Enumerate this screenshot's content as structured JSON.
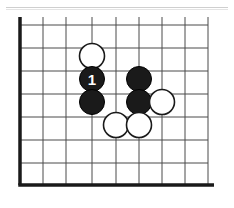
{
  "figure": {
    "kind": "go-board-diagram",
    "title": "",
    "caption": "",
    "background_color": "#ffffff"
  },
  "page_rule": {
    "visible": true,
    "color": "#cfcfcf"
  },
  "board": {
    "colors": {
      "line": "#4a4a4a",
      "edge": "#1a1a1a",
      "black_stone_fill": "#1a1a1a",
      "black_stone_stroke": "#000000",
      "white_stone_fill": "#ffffff",
      "white_stone_stroke": "#1a1a1a",
      "label_on_black": "#ffffff",
      "board_background": "#ffffff"
    },
    "geometry": {
      "origin_x": 20,
      "origin_y": 25,
      "spacing": 23,
      "columns": 9,
      "rows": 8,
      "stone_radius": 12.5,
      "left_edge_thickness": 3.5,
      "bottom_edge_thickness": 3.5,
      "line_thickness": 1,
      "bottom_y": 185,
      "right_x": 208,
      "top_cut_y": 17
    },
    "edges": {
      "left": true,
      "bottom": true,
      "top": false,
      "right": false
    },
    "column_x": [
      20,
      43,
      66,
      92,
      116,
      139,
      162,
      185,
      208
    ],
    "row_y": [
      25,
      48,
      71,
      94,
      117,
      140,
      163,
      185
    ]
  },
  "stones": [
    {
      "id": "w-c4r2",
      "color": "white",
      "col": 3,
      "row": 1,
      "cx": 92,
      "cy": 56,
      "label": ""
    },
    {
      "id": "b-c4r3",
      "color": "black",
      "col": 3,
      "row": 2,
      "cx": 92,
      "cy": 79,
      "label": "1"
    },
    {
      "id": "b-c4r4",
      "color": "black",
      "col": 3,
      "row": 3,
      "cx": 92,
      "cy": 102,
      "label": ""
    },
    {
      "id": "b-c6r3",
      "color": "black",
      "col": 5,
      "row": 2,
      "cx": 139,
      "cy": 79,
      "label": ""
    },
    {
      "id": "b-c6r4",
      "color": "black",
      "col": 5,
      "row": 3,
      "cx": 139,
      "cy": 102,
      "label": ""
    },
    {
      "id": "w-c7r4",
      "color": "white",
      "col": 6,
      "row": 3,
      "cx": 162,
      "cy": 102,
      "label": ""
    },
    {
      "id": "w-c5r5",
      "color": "white",
      "col": 4,
      "row": 4,
      "cx": 116,
      "cy": 125,
      "label": ""
    },
    {
      "id": "w-c6r5",
      "color": "white",
      "col": 5,
      "row": 4,
      "cx": 139,
      "cy": 125,
      "label": ""
    }
  ],
  "move_labels": [
    {
      "number": "1",
      "stone_id": "b-c4r3"
    }
  ]
}
